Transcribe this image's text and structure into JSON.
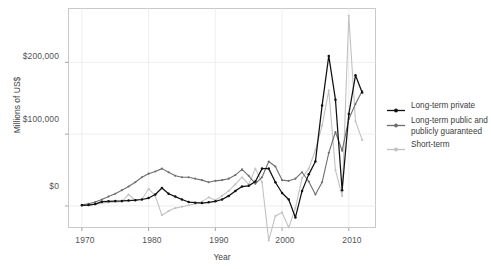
{
  "chart_data": {
    "type": "line",
    "title": "",
    "xlabel": "Year",
    "ylabel": "Millions of US$",
    "xlim": [
      1968,
      2014
    ],
    "ylim": [
      -30000,
      275000
    ],
    "xticks": [
      "1970",
      "1980",
      "1990",
      "2000",
      "2010"
    ],
    "xtick_values": [
      1970,
      1980,
      1990,
      2000,
      2010
    ],
    "yticks": [
      "$0",
      "$100,000",
      "$200,000"
    ],
    "ytick_values": [
      0,
      100000,
      200000
    ],
    "grid": true,
    "legend_position": "right",
    "x": [
      1970,
      1971,
      1972,
      1973,
      1974,
      1975,
      1976,
      1977,
      1978,
      1979,
      1980,
      1981,
      1982,
      1983,
      1984,
      1985,
      1986,
      1987,
      1988,
      1989,
      1990,
      1991,
      1992,
      1993,
      1994,
      1995,
      1996,
      1997,
      1998,
      1999,
      2000,
      2001,
      2002,
      2003,
      2004,
      2005,
      2006,
      2007,
      2008,
      2009,
      2010,
      2011,
      2012
    ],
    "series": [
      {
        "name": "Long-term private",
        "color": "#111111",
        "values": [
          900,
          1200,
          2600,
          6000,
          6500,
          6800,
          7000,
          7500,
          8000,
          9000,
          11000,
          16000,
          25000,
          17000,
          13000,
          9000,
          5500,
          4500,
          4000,
          5000,
          6500,
          9000,
          14000,
          21000,
          27000,
          28000,
          34000,
          52000,
          52000,
          33000,
          18000,
          9000,
          -16000,
          21000,
          44000,
          62000,
          140000,
          209000,
          148000,
          22000,
          128000,
          182000,
          158000
        ]
      },
      {
        "name": "Long-term public and publicly guaranteed",
        "color": "#6e6e6e",
        "values": [
          1500,
          3000,
          5500,
          9000,
          13000,
          17000,
          22000,
          27000,
          33000,
          40000,
          45000,
          48000,
          52000,
          47000,
          42000,
          40000,
          40000,
          38000,
          36000,
          33000,
          35000,
          36000,
          38000,
          43000,
          51000,
          42000,
          31000,
          40000,
          62000,
          55000,
          36000,
          35000,
          38000,
          47000,
          34000,
          16000,
          33000,
          74000,
          103000,
          77000,
          121000,
          142000,
          160000
        ]
      },
      {
        "name": "Short-term",
        "color": "#c2c2c2",
        "values": [
          800,
          1400,
          2200,
          4000,
          5000,
          5500,
          6000,
          16000,
          8000,
          9000,
          24000,
          14000,
          -13000,
          -7000,
          -3000,
          -1000,
          1000,
          3000,
          6000,
          12000,
          8000,
          14000,
          21000,
          30000,
          40000,
          30000,
          52000,
          33000,
          -48000,
          -14000,
          -9000,
          -30000,
          -3000,
          39000,
          52000,
          78000,
          112000,
          161000,
          50000,
          14000,
          265000,
          118000,
          92000
        ]
      }
    ]
  },
  "legend": {
    "items": [
      {
        "label": "Long-term private",
        "color": "#111111",
        "marker": "line-with-point"
      },
      {
        "label": "Long-term public and\npublicly guaranteed",
        "color": "#6e6e6e",
        "marker": "line-with-point"
      },
      {
        "label": "Short-term",
        "color": "#c2c2c2",
        "marker": "line-with-point"
      }
    ]
  },
  "axes": {
    "y_label": "Millions of US$",
    "x_label": "Year",
    "y_tick_labels": [
      "$200,000",
      "$100,000",
      "$0"
    ],
    "x_tick_labels": [
      "1970",
      "1980",
      "1990",
      "2000",
      "2010"
    ]
  }
}
